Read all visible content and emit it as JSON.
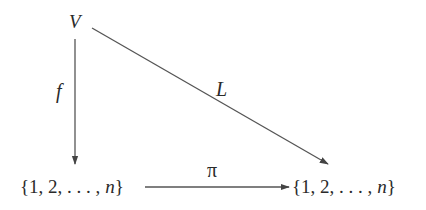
{
  "diagram": {
    "type": "commutative-diagram",
    "nodes": {
      "V": {
        "label": "V"
      },
      "left_set": {
        "prefix": "{1, 2, . . . , ",
        "var": "n",
        "suffix": "}"
      },
      "right_set": {
        "prefix": "{1, 2, . . . , ",
        "var": "n",
        "suffix": "}"
      }
    },
    "edges": {
      "f": {
        "from": "V",
        "to": "left_set",
        "label": "f"
      },
      "L": {
        "from": "V",
        "to": "right_set",
        "label": "L"
      },
      "pi": {
        "from": "left_set",
        "to": "right_set",
        "label": "π"
      }
    },
    "colors": {
      "stroke": "#555555",
      "text": "#2a2a2a",
      "background": "#ffffff"
    }
  }
}
